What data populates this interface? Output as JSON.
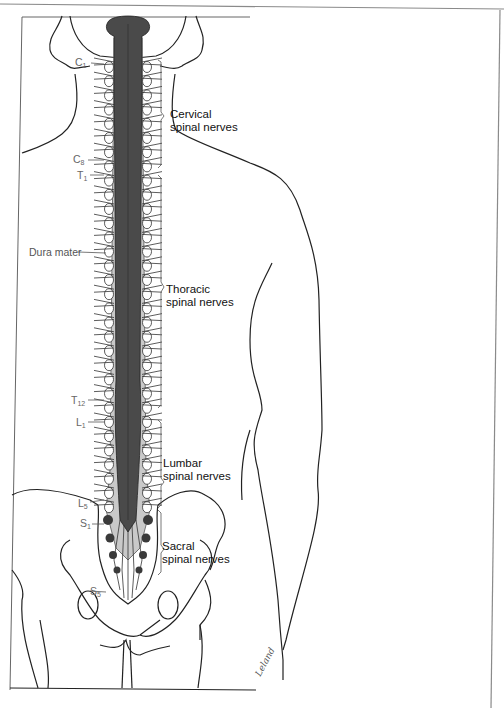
{
  "figure": {
    "type": "anatomical-illustration",
    "colors": {
      "cord": "#4a4a4a",
      "dura": "#7a7a7a",
      "outline": "#222222",
      "frame": "#8a8a8a",
      "background": "#ffffff"
    }
  },
  "segment_labels": [
    {
      "id": "c1",
      "letter": "C",
      "num": "1"
    },
    {
      "id": "c8",
      "letter": "C",
      "num": "8"
    },
    {
      "id": "t1",
      "letter": "T",
      "num": "1"
    },
    {
      "id": "t12",
      "letter": "T",
      "num": "12"
    },
    {
      "id": "l1",
      "letter": "L",
      "num": "1"
    },
    {
      "id": "l5",
      "letter": "L",
      "num": "5"
    },
    {
      "id": "s1",
      "letter": "S",
      "num": "1"
    },
    {
      "id": "s5",
      "letter": "S",
      "num": "5"
    }
  ],
  "group_labels": [
    {
      "id": "cervical",
      "text": "Cervical\nspinal nerves"
    },
    {
      "id": "thoracic",
      "text": "Thoracic\nspinal nerves"
    },
    {
      "id": "lumbar",
      "text": "Lumbar\nspinal nerves"
    },
    {
      "id": "sacral",
      "text": "Sacral\nspinal nerves"
    }
  ],
  "structure_labels": {
    "dura_mater": "Dura mater"
  },
  "signature": "Leland"
}
